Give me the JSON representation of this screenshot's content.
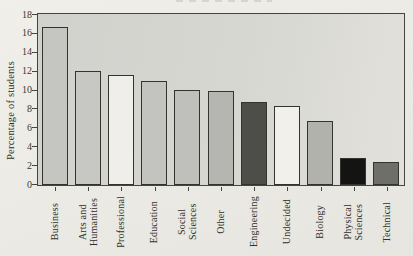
{
  "chart_data": {
    "type": "bar",
    "title": "",
    "xlabel": "",
    "ylabel": "Percentage of students",
    "ylim": [
      0,
      18
    ],
    "ytick_step": 2,
    "grid": false,
    "legend": "none",
    "categories": [
      "Business",
      "Arts and\nHumanities",
      "Professional",
      "Education",
      "Social Sciences",
      "Other",
      "Engineering",
      "Undecided",
      "Biology",
      "Physical\nSciences",
      "Technical"
    ],
    "values": [
      16.7,
      12.1,
      11.6,
      11.0,
      10.1,
      10.0,
      8.8,
      8.4,
      6.8,
      2.9,
      2.4
    ],
    "bar_colors": [
      "#c5c5c1",
      "#c7c7c3",
      "#efeeea",
      "#c3c3bf",
      "#bfbfbb",
      "#b5b5b1",
      "#4d4d49",
      "#f1f0ec",
      "#b1b1ad",
      "#141412",
      "#6e6e6a"
    ],
    "bar_border_color": "#34342f",
    "axis_color": "#45443f",
    "plot_bg": "#d7d7d2",
    "page_bg": "#eae9e4"
  }
}
